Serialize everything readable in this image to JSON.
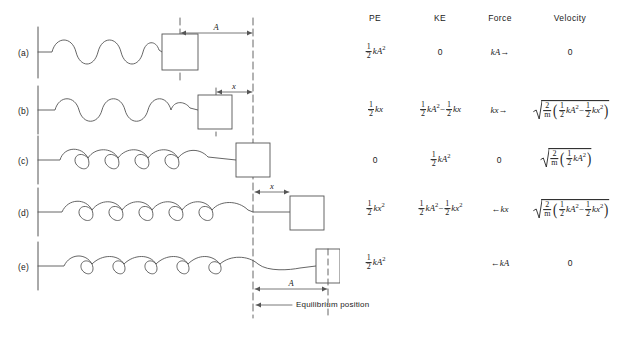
{
  "figure": {
    "caption_label": "Equilibrium position",
    "dimension_A": "A",
    "dimension_x": "x"
  },
  "table": {
    "columns": [
      {
        "label": "PE"
      },
      {
        "label": "KE"
      },
      {
        "label": "Force"
      },
      {
        "label": "Velocity"
      }
    ]
  },
  "rows": [
    {
      "id": "a",
      "label": "(a)",
      "state": "fully compressed, block at maximum compression left of equilibrium",
      "dimension": "A",
      "pe_text": "1/2 kA^2",
      "ke_text": "0",
      "force_text": "kA→",
      "velocity_text": "0"
    },
    {
      "id": "b",
      "label": "(b)",
      "state": "partly compressed, block a distance x left of equilibrium",
      "dimension": "x",
      "pe_text": "1/2 kx",
      "ke_text": "1/2 kA^2 - 1/2 kx",
      "force_text": "kx→",
      "velocity_text": "sqrt(2/m (1/2 kA^2 - 1/2 kx^2))"
    },
    {
      "id": "c",
      "label": "(c)",
      "state": "relaxed spring, block at equilibrium position",
      "dimension": "",
      "pe_text": "0",
      "ke_text": "1/2 kA^2",
      "force_text": "0",
      "velocity_text": "sqrt(2/m (1/2 kA^2))"
    },
    {
      "id": "d",
      "label": "(d)",
      "state": "stretched, block a distance x right of equilibrium",
      "dimension": "x",
      "pe_text": "1/2 kx^2",
      "ke_text": "1/2 kA^2 - 1/2 kx^2",
      "force_text": "←kx",
      "velocity_text": "sqrt(2/m (1/2 kA^2 - 1/2 kx^2))"
    },
    {
      "id": "e",
      "label": "(e)",
      "state": "fully stretched, block at maximum extension A right of equilibrium",
      "dimension": "A",
      "pe_text": "1/2 kA^2",
      "ke_text": "",
      "force_text": "←kA",
      "velocity_text": "0"
    }
  ],
  "symbols": {
    "one": "1",
    "two": "2",
    "k": "k",
    "A": "A",
    "x": "x",
    "m": "m",
    "zero": "0",
    "exp2": "2",
    "minus": "−",
    "arrow_right": "→",
    "arrow_left": "←"
  },
  "colors": {
    "ink": "#1a1a1a",
    "line": "#555555",
    "background": "#ffffff"
  }
}
